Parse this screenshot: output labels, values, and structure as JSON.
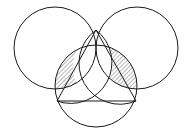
{
  "figure": {
    "type": "geometric-diagram",
    "canvas": {
      "width": 191,
      "height": 135
    },
    "colors": {
      "stroke": "#1a1a1a",
      "background": "#ffffff",
      "hatch": "#333333",
      "unshaded_fill": "#ffffff"
    },
    "stroke_width": 1,
    "hatch": {
      "pattern": "diagonal-lines",
      "direction": "forward-slash",
      "angle_deg": 45,
      "spacing_px": 3,
      "line_width": 0.7
    },
    "circles": [
      {
        "name": "left-circle",
        "cx": 55,
        "cy": 48,
        "r": 41
      },
      {
        "name": "right-circle",
        "cx": 137,
        "cy": 48,
        "r": 41
      },
      {
        "name": "bottom-circle",
        "cx": 96,
        "cy": 86,
        "r": 41
      }
    ],
    "vertices": [
      {
        "name": "top-vertex",
        "x": 96,
        "y": 30
      },
      {
        "name": "bottom-left-vertex",
        "x": 57,
        "y": 101
      },
      {
        "name": "bottom-right-vertex",
        "x": 136,
        "y": 101
      }
    ],
    "segments": [
      {
        "name": "base-chord",
        "x1": 57,
        "y1": 101,
        "x2": 136,
        "y2": 101
      },
      {
        "name": "left-diagonal",
        "x1": 96,
        "y1": 30,
        "x2": 57,
        "y2": 101
      },
      {
        "name": "right-diagonal",
        "x1": 96,
        "y1": 30,
        "x2": 136,
        "y2": 101
      }
    ],
    "regions": [
      {
        "name": "left-hatched-lens",
        "shaded": true,
        "description": "lens between left circle arc and bottom circle arc"
      },
      {
        "name": "right-hatched-lens",
        "shaded": true,
        "description": "lens between right circle arc and bottom circle arc"
      },
      {
        "name": "center-white-petal",
        "shaded": false,
        "description": "central unshaded petal between the two diagonals"
      }
    ]
  }
}
